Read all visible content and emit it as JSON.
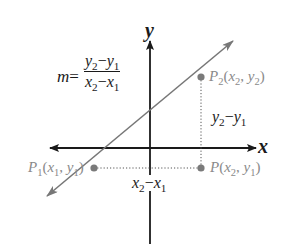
{
  "diagram": {
    "axes": {
      "x_label": "x",
      "y_label": "y"
    },
    "formula": {
      "lhs": "m",
      "equals": "=",
      "numerator": {
        "a": "y",
        "a_sub": "2",
        "op": "−",
        "b": "y",
        "b_sub": "1"
      },
      "denominator": {
        "a": "x",
        "a_sub": "2",
        "op": "−",
        "b": "x",
        "b_sub": "1"
      }
    },
    "points": [
      {
        "id": "P2",
        "name": "P",
        "name_sub": "2",
        "coords": "(x₂, y₂)",
        "cx": "x",
        "cx_sub": "2",
        "cy": "y",
        "cy_sub": "2"
      },
      {
        "id": "P1",
        "name": "P",
        "name_sub": "1",
        "coords": "(x₁, y₁)",
        "cx": "x",
        "cx_sub": "1",
        "cy": "y",
        "cy_sub": "1"
      },
      {
        "id": "P",
        "name": "P",
        "name_sub": "",
        "coords": "(x₂, y₁)",
        "cx": "x",
        "cx_sub": "2",
        "cy": "y",
        "cy_sub": "1"
      }
    ],
    "rise_label": {
      "a": "y",
      "a_sub": "2",
      "op": "−",
      "b": "y",
      "b_sub": "1"
    },
    "run_label": {
      "a": "x",
      "a_sub": "2",
      "op": "−",
      "b": "x",
      "b_sub": "1"
    },
    "colors": {
      "axis": "#1a1a1a",
      "line": "#777777",
      "point": "#7a7a7a",
      "point_label": "#8a8a8a",
      "dotted": "#555555"
    }
  }
}
